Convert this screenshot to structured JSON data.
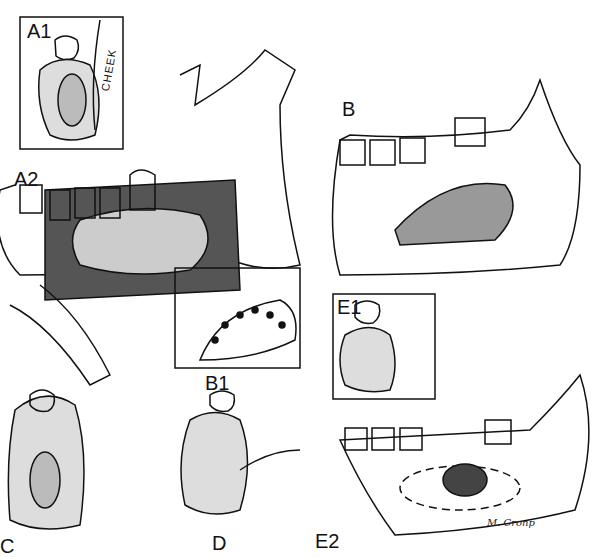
{
  "panels": {
    "a1": {
      "label": "A1",
      "annotation": "CHEEK"
    },
    "a2": {
      "label": "A2"
    },
    "b": {
      "label": "B"
    },
    "b1": {
      "label": "B1"
    },
    "c": {
      "label": "C"
    },
    "d": {
      "label": "D"
    },
    "e1": {
      "label": "E1"
    },
    "e2": {
      "label": "E2"
    }
  },
  "signature": "M. Cronp"
}
